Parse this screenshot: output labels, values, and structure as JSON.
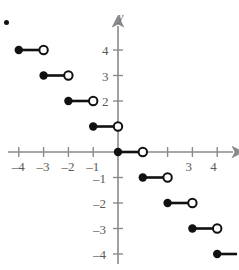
{
  "figure": {
    "axis_name_y": "y",
    "axis_color": "#8a8a8a",
    "curve_color": "#111111",
    "label_color": "#5a5a5a",
    "background": "#ffffff",
    "stray_mark": {
      "name": "bullet-dot",
      "x": 6,
      "y": 22
    }
  },
  "chart_data": {
    "type": "line",
    "title": "",
    "xlabel": "",
    "ylabel": "y",
    "xlim": [
      -4.8,
      4.9
    ],
    "ylim": [
      -4.6,
      4.7
    ],
    "grid": false,
    "legend": false,
    "x_ticks": [
      -4,
      -3,
      -2,
      -1,
      1,
      2,
      3,
      4
    ],
    "x_tick_labels": [
      "–4",
      "–3",
      "–2",
      "–1",
      "",
      "",
      "3",
      "4"
    ],
    "y_ticks": [
      4,
      3,
      2,
      1,
      -1,
      -2,
      -3,
      -4
    ],
    "y_tick_labels": [
      "4",
      "3",
      "2",
      "",
      "–1",
      "–2",
      "–3",
      "–4"
    ],
    "segments": [
      {
        "x_start": -4,
        "x_end": -3,
        "y": 4,
        "left_endpoint": "closed",
        "right_endpoint": "open"
      },
      {
        "x_start": -3,
        "x_end": -2,
        "y": 3,
        "left_endpoint": "closed",
        "right_endpoint": "open"
      },
      {
        "x_start": -2,
        "x_end": -1,
        "y": 2,
        "left_endpoint": "closed",
        "right_endpoint": "open"
      },
      {
        "x_start": -1,
        "x_end": 0,
        "y": 1,
        "left_endpoint": "closed",
        "right_endpoint": "open"
      },
      {
        "x_start": 0,
        "x_end": 1,
        "y": 0,
        "left_endpoint": "closed",
        "right_endpoint": "open"
      },
      {
        "x_start": 1,
        "x_end": 2,
        "y": -1,
        "left_endpoint": "closed",
        "right_endpoint": "open"
      },
      {
        "x_start": 2,
        "x_end": 3,
        "y": -2,
        "left_endpoint": "closed",
        "right_endpoint": "open"
      },
      {
        "x_start": 3,
        "x_end": 4,
        "y": -3,
        "left_endpoint": "closed",
        "right_endpoint": "open"
      },
      {
        "x_start": 4,
        "x_end": 4.8,
        "y": -4,
        "left_endpoint": "closed",
        "right_endpoint": "none"
      }
    ]
  }
}
